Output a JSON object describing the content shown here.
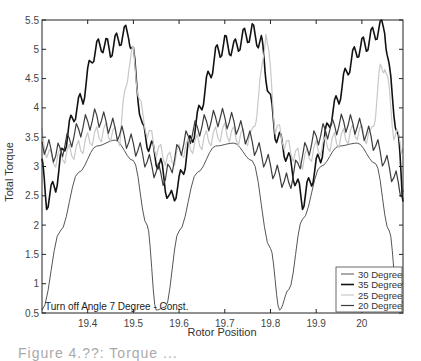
{
  "chart_data": {
    "type": "line",
    "title": "",
    "xlabel": "Rotor Position",
    "ylabel": "Total Torque",
    "xlim": [
      19.3,
      20.09
    ],
    "ylim": [
      0.5,
      5.5
    ],
    "x_ticks": [
      19.4,
      19.5,
      19.6,
      19.7,
      19.8,
      19.9,
      20
    ],
    "x_tick_labels": [
      "19.4",
      "19.5",
      "19.6",
      "19.7",
      "19.8",
      "19.9",
      "20"
    ],
    "y_ticks": [
      0.5,
      1,
      1.5,
      2,
      2.5,
      3,
      3.5,
      4,
      4.5,
      5,
      5.5
    ],
    "y_tick_labels": [
      "0.5",
      "1",
      "1.5",
      "2",
      "2.5",
      "3",
      "3.5",
      "4",
      "4.5",
      "5",
      "5.5"
    ],
    "grid": false,
    "legend_position": "lower right",
    "annotation": "Turn off Angle 7 Degree - Const.",
    "period": 0.27,
    "series": [
      {
        "name": "30 Degree",
        "color": "#555555",
        "width": 1,
        "x": [
          19.3,
          19.34,
          19.38,
          19.42,
          19.46,
          19.5,
          19.53,
          19.55,
          19.57,
          19.6,
          19.64,
          19.68,
          19.72,
          19.76,
          19.8,
          19.82,
          19.84,
          19.87,
          19.91,
          19.95,
          19.99,
          20.03,
          20.06,
          20.08,
          20.09
        ],
        "values": [
          0.55,
          1.9,
          2.9,
          3.35,
          3.45,
          3.1,
          2.0,
          0.55,
          0.6,
          1.9,
          2.9,
          3.35,
          3.4,
          3.1,
          1.6,
          0.55,
          0.9,
          2.1,
          3.0,
          3.35,
          3.4,
          3.05,
          1.9,
          0.55,
          0.7
        ]
      },
      {
        "name": "35 Degree",
        "color": "#111111",
        "width": 1.6,
        "x": [
          19.3,
          19.31,
          19.33,
          19.35,
          19.37,
          19.39,
          19.41,
          19.43,
          19.45,
          19.47,
          19.49,
          19.5,
          19.52,
          19.54,
          19.56,
          19.58,
          19.6,
          19.62,
          19.64,
          19.66,
          19.68,
          19.7,
          19.72,
          19.74,
          19.76,
          19.78,
          19.79,
          19.81,
          19.83,
          19.85,
          19.87,
          19.89,
          19.91,
          19.93,
          19.95,
          19.97,
          19.99,
          20.01,
          20.03,
          20.05,
          20.06,
          20.08,
          20.09
        ],
        "values": [
          3.0,
          2.4,
          2.7,
          3.4,
          3.9,
          4.2,
          4.9,
          5.1,
          5.0,
          5.2,
          5.3,
          4.9,
          3.6,
          3.3,
          3.0,
          2.4,
          2.7,
          3.3,
          3.8,
          4.4,
          4.9,
          5.1,
          5.0,
          5.2,
          5.3,
          5.1,
          4.6,
          3.6,
          3.3,
          2.9,
          2.4,
          2.8,
          3.2,
          3.8,
          4.2,
          4.7,
          5.0,
          5.1,
          5.3,
          5.4,
          4.6,
          3.4,
          2.4
        ]
      },
      {
        "name": "25 Degree",
        "color": "#c8c8c8",
        "width": 1.2,
        "x": [
          19.3,
          19.32,
          19.35,
          19.38,
          19.41,
          19.44,
          19.47,
          19.48,
          19.49,
          19.5,
          19.52,
          19.55,
          19.58,
          19.61,
          19.64,
          19.67,
          19.7,
          19.73,
          19.76,
          19.77,
          19.78,
          19.79,
          19.81,
          19.84,
          19.87,
          19.9,
          19.93,
          19.96,
          19.99,
          20.02,
          20.03,
          20.04,
          20.05,
          20.07,
          20.09
        ],
        "values": [
          3.5,
          3.1,
          3.2,
          3.3,
          3.5,
          3.6,
          3.5,
          4.1,
          4.8,
          4.9,
          3.8,
          3.3,
          3.1,
          3.3,
          3.4,
          3.5,
          3.6,
          3.5,
          3.5,
          4.0,
          4.5,
          5.4,
          3.7,
          3.3,
          3.1,
          3.3,
          3.4,
          3.5,
          3.6,
          3.5,
          4.0,
          4.6,
          4.8,
          3.6,
          3.3
        ]
      },
      {
        "name": "20 Degree",
        "color": "#3c3c3c",
        "width": 1.2,
        "x": [
          19.3,
          19.33,
          19.36,
          19.39,
          19.42,
          19.45,
          19.48,
          19.51,
          19.54,
          19.57,
          19.6,
          19.63,
          19.66,
          19.69,
          19.72,
          19.75,
          19.78,
          19.81,
          19.84,
          19.87,
          19.9,
          19.93,
          19.96,
          19.99,
          20.02,
          20.05,
          20.08,
          20.09
        ],
        "values": [
          3.4,
          3.2,
          3.45,
          3.7,
          3.85,
          3.7,
          3.5,
          3.3,
          3.0,
          2.8,
          3.3,
          3.6,
          3.75,
          3.85,
          3.75,
          3.5,
          3.2,
          2.9,
          2.7,
          3.2,
          3.5,
          3.65,
          3.75,
          3.7,
          3.5,
          3.1,
          2.7,
          2.6
        ]
      }
    ]
  },
  "figure": {
    "caption_fragment": "Figure 4.??: Torque ..."
  }
}
